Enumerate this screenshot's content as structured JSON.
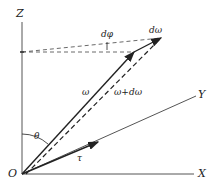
{
  "diagram": {
    "axes": {
      "x_label": "X",
      "y_label": "Y",
      "z_label": "Z",
      "origin_label": "O"
    },
    "vectors": {
      "omega": "ω",
      "omega_plus_domega": "ω+dω",
      "domega": "dω",
      "tau": "τ"
    },
    "angles": {
      "theta": "θ",
      "dphi": "dφ"
    },
    "colors": {
      "line": "#222222",
      "axis": "#555555"
    }
  }
}
